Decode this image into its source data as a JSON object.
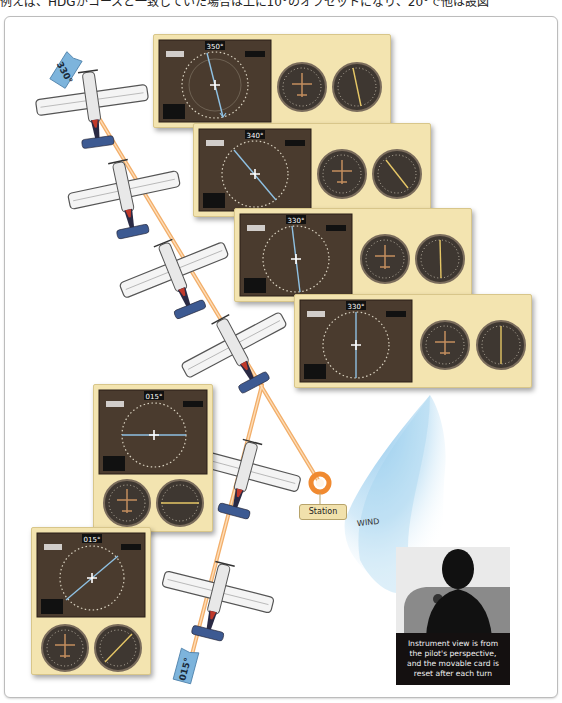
{
  "header": {
    "text": "例えば、HDGがコースと一致していた場合は上に10°のオフセットになり、20°で他は設図"
  },
  "diagram": {
    "station_label": "Station",
    "wind_label": "WIND",
    "caption_lines": [
      "Instrument view is from",
      "the pilot's perspective,",
      "and the movable card is",
      "reset after each turn"
    ],
    "flags": {
      "top": "330°",
      "bottom": "015°"
    },
    "panels": [
      {
        "id": "panel-1",
        "heading": "350°"
      },
      {
        "id": "panel-2",
        "heading": "340°"
      },
      {
        "id": "panel-3",
        "heading": "330°"
      },
      {
        "id": "panel-4",
        "heading": "330°"
      },
      {
        "id": "panel-5",
        "heading": "015°"
      },
      {
        "id": "panel-6",
        "heading": "015°"
      }
    ],
    "colors": {
      "panel_bg": "#f3e4b0",
      "display_bg": "#4a3b2e",
      "track_line": "#f0a050",
      "station_ring": "#f08a30",
      "wind": "#9fd0ef",
      "airplane_tail": "#3d5a92"
    }
  }
}
